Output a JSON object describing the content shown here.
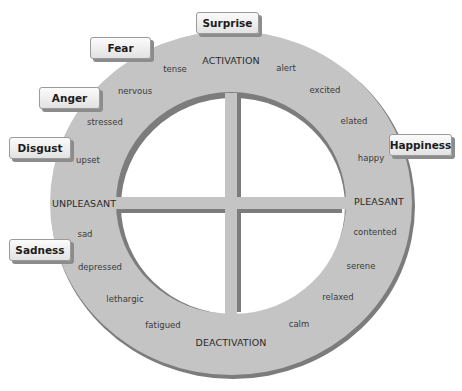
{
  "diagram": {
    "type": "circumplex-model-of-affect",
    "axes": {
      "top": "ACTIVATION",
      "bottom": "DEACTIVATION",
      "left": "UNPLEASANT",
      "right": "PLEASANT"
    },
    "ring_words": {
      "tense": "tense",
      "nervous": "nervous",
      "stressed": "stressed",
      "upset": "upset",
      "alert": "alert",
      "excited": "excited",
      "elated": "elated",
      "happy": "happy",
      "sad": "sad",
      "depressed": "depressed",
      "lethargic": "lethargic",
      "fatigued": "fatigued",
      "contented": "contented",
      "serene": "serene",
      "relaxed": "relaxed",
      "calm": "calm"
    },
    "emotions": {
      "surprise": "Surprise",
      "fear": "Fear",
      "anger": "Anger",
      "disgust": "Disgust",
      "happiness": "Happiness",
      "sadness": "Sadness"
    },
    "colors": {
      "ring_fill": "#c4c4c4",
      "ring_edge": "#7a7a7a",
      "cross_fill": "#c4c4c4",
      "cross_shadow": "#7a7a7a",
      "label_box": "#eeeeee"
    }
  }
}
